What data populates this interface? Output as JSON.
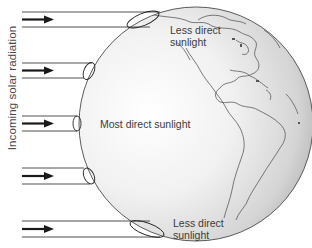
{
  "diagram": {
    "axis_label": "Incoming solar radiation",
    "labels": {
      "top": {
        "line1": "Less direct",
        "line2": "sunlight"
      },
      "middle": "Most direct sunlight",
      "bottom": {
        "line1": "Less direct",
        "line2": "sunlight"
      }
    },
    "beams": [
      {
        "name": "beam-top",
        "y_top": 12,
        "y_bottom": 27
      },
      {
        "name": "beam-upper",
        "y_top": 63,
        "y_bottom": 78
      },
      {
        "name": "beam-center",
        "y_top": 116,
        "y_bottom": 131
      },
      {
        "name": "beam-lower",
        "y_top": 168,
        "y_bottom": 184
      },
      {
        "name": "beam-bottom",
        "y_top": 221,
        "y_bottom": 237
      }
    ],
    "colors": {
      "beam_line": "#3c3c3c",
      "arrow": "#1a1a1a",
      "globe_outline": "#4a4a4a",
      "globe_fill_light": "#f6f6f6",
      "globe_fill_dark": "#b8b8b8",
      "coastline": "#5a5a5a",
      "text": "#3a3a3a"
    }
  }
}
